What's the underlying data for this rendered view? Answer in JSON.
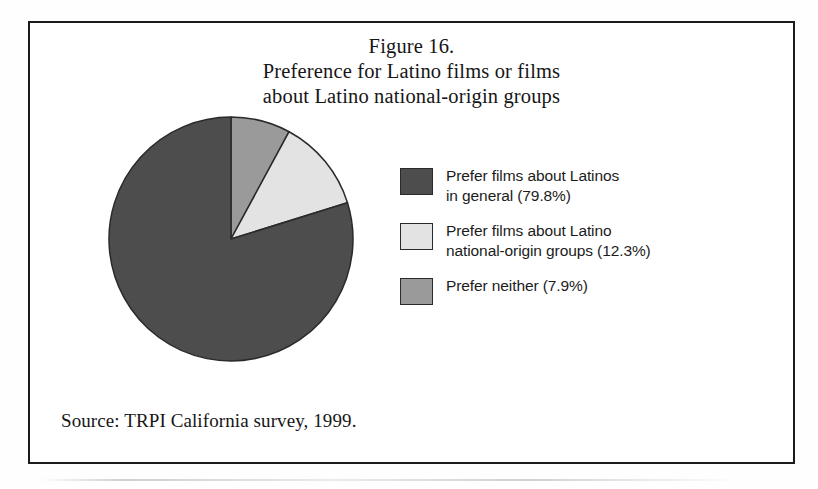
{
  "figure": {
    "title_lines": [
      "Figure 16.",
      "Preference for Latino films or films",
      "about Latino national-origin groups"
    ],
    "source_note": "Source: TRPI California survey, 1999."
  },
  "legend": {
    "items": [
      {
        "swatch_color": "#4d4d4d",
        "lines": [
          "Prefer films about Latinos",
          "in general (79.8%)"
        ]
      },
      {
        "swatch_color": "#e3e3e3",
        "lines": [
          "Prefer films about Latino",
          "national-origin groups (12.3%)"
        ]
      },
      {
        "swatch_color": "#9a9a9a",
        "lines": [
          "Prefer neither (7.9%)"
        ]
      }
    ]
  },
  "chart_data": {
    "type": "pie",
    "title": "Preference for Latino films or films about Latino national-origin groups",
    "categories": [
      "Prefer neither",
      "Prefer films about Latino national-origin groups",
      "Prefer films about Latinos in general"
    ],
    "values": [
      7.9,
      12.3,
      79.8
    ],
    "value_unit": "%",
    "colors": [
      "#9a9a9a",
      "#e3e3e3",
      "#4d4d4d"
    ],
    "start_angle_deg": 0,
    "direction": "clockwise",
    "legend_position": "right",
    "grid": false,
    "labels_shown": false
  }
}
